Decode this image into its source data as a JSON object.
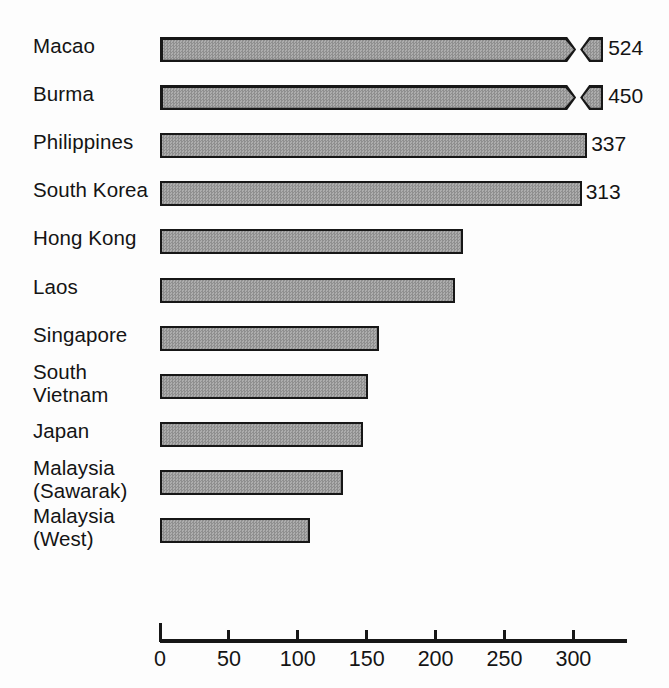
{
  "chart_data": {
    "type": "bar",
    "orientation": "horizontal",
    "title": "",
    "subtitle": "",
    "xlabel": "",
    "ylabel": "",
    "xlim": [
      0,
      340
    ],
    "grid": false,
    "legend": null,
    "axis_break_note": "Bars for Macao and Burma exceed the axis range and are drawn with an axis break (zigzag) plus a detached stub segment; their true values are shown as data labels.",
    "categories": [
      "Macao",
      "Burma",
      "Philippines",
      "South Korea",
      "Hong Kong",
      "Laos",
      "Singapore",
      "South\nVietnam",
      "Japan",
      "Malaysia\n(Sawarak)",
      "Malaysia\n(West)"
    ],
    "values": [
      524,
      450,
      337,
      313,
      220,
      214,
      159,
      151,
      147,
      133,
      109
    ],
    "data_labels": [
      "524",
      "450",
      "337",
      "313",
      "",
      "",
      "",
      "",
      "",
      "",
      ""
    ],
    "xticks": [
      0,
      50,
      100,
      150,
      200,
      250,
      300
    ],
    "xtick_labels": [
      "0",
      "50",
      "100",
      "150",
      "200",
      "250",
      "300"
    ]
  },
  "bars": [
    {
      "label": "Macao",
      "lines": 1,
      "value": 524,
      "drawn_to": 302,
      "broken": true,
      "value_label": "524"
    },
    {
      "label": "Burma",
      "lines": 1,
      "value": 450,
      "drawn_to": 302,
      "broken": true,
      "value_label": "450"
    },
    {
      "label": "Philippines",
      "lines": 1,
      "value": 337,
      "drawn_to": 310,
      "broken": false,
      "value_label": "337"
    },
    {
      "label": "South Korea",
      "lines": 1,
      "value": 313,
      "drawn_to": 306,
      "broken": false,
      "value_label": "313"
    },
    {
      "label": "Hong Kong",
      "lines": 1,
      "value": 220,
      "drawn_to": 220,
      "broken": false,
      "value_label": ""
    },
    {
      "label": "Laos",
      "lines": 1,
      "value": 214,
      "drawn_to": 214,
      "broken": false,
      "value_label": ""
    },
    {
      "label": "Singapore",
      "lines": 1,
      "value": 159,
      "drawn_to": 159,
      "broken": false,
      "value_label": ""
    },
    {
      "label": "South\nVietnam",
      "lines": 2,
      "value": 151,
      "drawn_to": 151,
      "broken": false,
      "value_label": ""
    },
    {
      "label": "Japan",
      "lines": 1,
      "value": 147,
      "drawn_to": 147,
      "broken": false,
      "value_label": ""
    },
    {
      "label": "Malaysia\n(Sawarak)",
      "lines": 2,
      "value": 133,
      "drawn_to": 133,
      "broken": false,
      "value_label": ""
    },
    {
      "label": "Malaysia\n(West)",
      "lines": 2,
      "value": 109,
      "drawn_to": 109,
      "broken": false,
      "value_label": ""
    }
  ],
  "axis": {
    "ticks": [
      {
        "value": 0,
        "label": "0"
      },
      {
        "value": 50,
        "label": "50"
      },
      {
        "value": 100,
        "label": "100"
      },
      {
        "value": 150,
        "label": "150"
      },
      {
        "value": 200,
        "label": "200"
      },
      {
        "value": 250,
        "label": "250"
      },
      {
        "value": 300,
        "label": "300"
      }
    ]
  },
  "style": {
    "bar_fill": "#9b9b9b",
    "bar_stroke": "#171717",
    "text_color": "#141414",
    "background": "#fdfdfd"
  }
}
